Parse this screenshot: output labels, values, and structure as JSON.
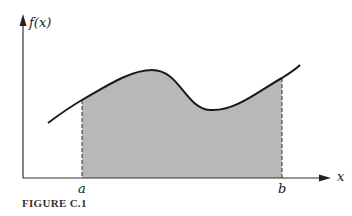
{
  "figure": {
    "caption": "FIGURE C.1",
    "y_axis_label": "f(x)",
    "x_axis_label": "x",
    "lower_bound_label": "a",
    "upper_bound_label": "b"
  },
  "colors": {
    "shade": "#b8b8b8",
    "curve": "#1a1a1a",
    "axis": "#333333",
    "background": "#ffffff"
  },
  "geometry": {
    "origin": [
      23,
      178
    ],
    "a_x": 82,
    "b_x": 282,
    "curve_path": "M48,123 C60,114 70,107 82,100 C105,87 130,70 152,70 C180,70 185,108 210,110 C235,112 260,90 282,78 C290,73 296,69 300,65",
    "shaded_path": "M82,178 L82,100 C105,87 130,70 152,70 C180,70 185,108 210,110 C235,112 260,90 282,78 L282,178 Z"
  }
}
